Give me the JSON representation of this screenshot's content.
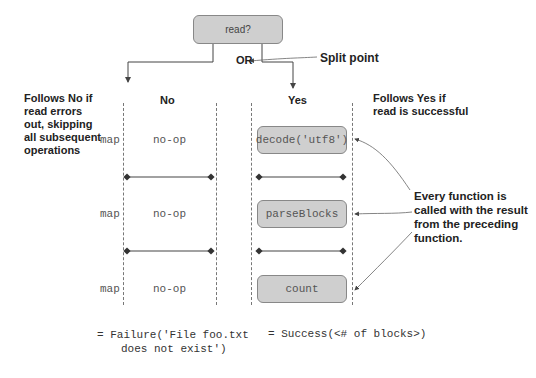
{
  "decision": {
    "label": "read?"
  },
  "split": {
    "or_label": "OR",
    "callout": "Split point"
  },
  "branches": {
    "no": {
      "label": "No",
      "annotation": [
        "Follows No if",
        "read errors",
        "out, skipping",
        "all subsequent",
        "operations"
      ]
    },
    "yes": {
      "label": "Yes",
      "annotation": [
        "Follows Yes if",
        "read is successful"
      ]
    }
  },
  "rows": [
    {
      "op": "map",
      "no_branch": "no-op",
      "yes_branch": "decode('utf8')"
    },
    {
      "op": "map",
      "no_branch": "no-op",
      "yes_branch": "parseBlocks"
    },
    {
      "op": "map",
      "no_branch": "no-op",
      "yes_branch": "count"
    }
  ],
  "callout_functions": [
    "Every function is",
    "called with the result",
    "from the preceding",
    "function."
  ],
  "results": {
    "failure": [
      "= Failure('File foo.txt",
      "does not exist')"
    ],
    "success": "= Success(<# of blocks>)"
  },
  "colors": {
    "node_fill": "#cfcfcf",
    "node_border": "#888888",
    "line": "#555555"
  }
}
